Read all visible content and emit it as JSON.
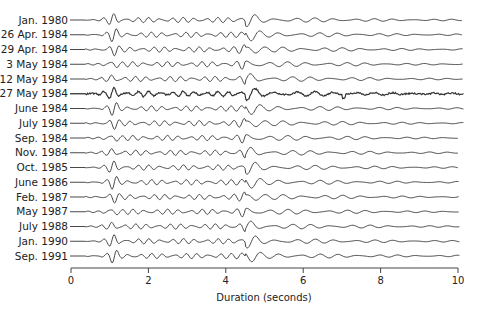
{
  "chart_data": {
    "type": "line",
    "title": "",
    "xlabel": "Duration (seconds)",
    "ylabel": "",
    "xlim": [
      0,
      10
    ],
    "x_ticks": [
      0,
      2,
      4,
      6,
      8,
      10
    ],
    "grid": false,
    "legend": "none",
    "series": [
      {
        "name": "Jan. 1980",
        "noisy": false
      },
      {
        "name": "26 Apr. 1984",
        "noisy": false
      },
      {
        "name": "29 Apr. 1984",
        "noisy": false
      },
      {
        "name": "3 May 1984",
        "noisy": false
      },
      {
        "name": "12 May 1984",
        "noisy": false
      },
      {
        "name": "27 May 1984",
        "noisy": true
      },
      {
        "name": "June 1984",
        "noisy": false
      },
      {
        "name": "July 1984",
        "noisy": false
      },
      {
        "name": "Sep. 1984",
        "noisy": false
      },
      {
        "name": "Nov. 1984",
        "noisy": false
      },
      {
        "name": "Oct. 1985",
        "noisy": false
      },
      {
        "name": "June 1986",
        "noisy": false
      },
      {
        "name": "Feb. 1987",
        "noisy": false
      },
      {
        "name": "May 1987",
        "noisy": false
      },
      {
        "name": "July 1988",
        "noisy": false
      },
      {
        "name": "Jan. 1990",
        "noisy": false
      },
      {
        "name": "Sep. 1991",
        "noisy": false
      }
    ],
    "annotations": {
      "first_arrival_seconds": 1.1,
      "main_phase_seconds": 4.5,
      "trace_end_seconds": 10
    }
  }
}
